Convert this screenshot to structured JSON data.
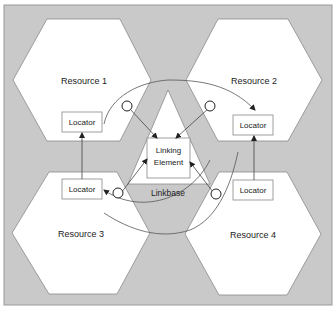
{
  "diagram": {
    "colors": {
      "background": "#c9c9c9",
      "frame_border": "#9a9a9a",
      "shape_fill": "#ffffff",
      "shape_stroke": "#8a8a8a",
      "line": "#333333"
    },
    "resources": [
      {
        "label": "Resource 1",
        "locator": "Locator"
      },
      {
        "label": "Resource 2",
        "locator": "Locator"
      },
      {
        "label": "Resource 3",
        "locator": "Locator"
      },
      {
        "label": "Resource 4",
        "locator": "Locator"
      }
    ],
    "linking_element": {
      "line1": "Linking",
      "line2": "Element"
    },
    "linkbase_label": "Linkbase"
  }
}
